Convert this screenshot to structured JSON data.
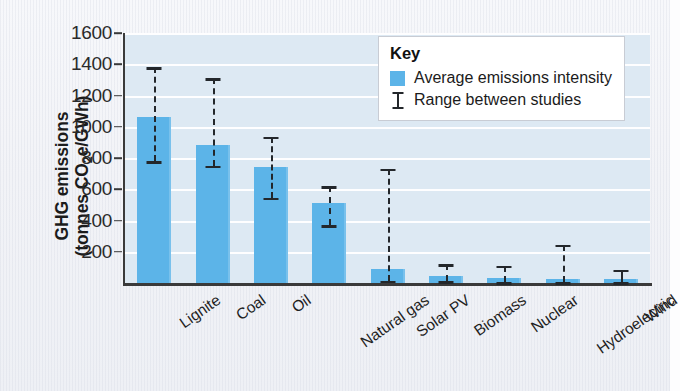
{
  "chart_data": {
    "type": "bar",
    "title": "",
    "xlabel": "",
    "ylabel_line1": "GHG emissions",
    "ylabel_line2_pre": "(tonnes CO",
    "ylabel_line2_sub": "2",
    "ylabel_line2_post": "e/GWh)",
    "ylim": [
      0,
      1600
    ],
    "ytick_values": [
      200,
      400,
      600,
      800,
      1000,
      1200,
      1400,
      1600
    ],
    "ytick_labels": [
      "200",
      "400",
      "600",
      "800",
      "1000",
      "1200",
      "1400",
      "1600"
    ],
    "grid": true,
    "legend_position": "top-right",
    "categories": [
      "Lignite",
      "Coal",
      "Oil",
      "Natural gas",
      "Solar PV",
      "Biomass",
      "Nuclear",
      "Hydroelectric",
      "Wind"
    ],
    "values": [
      1065,
      885,
      740,
      510,
      90,
      45,
      30,
      25,
      25
    ],
    "error_low": [
      780,
      750,
      545,
      370,
      15,
      10,
      5,
      5,
      5
    ],
    "error_high": [
      1380,
      1310,
      935,
      620,
      730,
      120,
      110,
      245,
      85
    ],
    "series": [
      {
        "name": "Average emissions intensity",
        "values": [
          1065,
          885,
          740,
          510,
          90,
          45,
          30,
          25,
          25
        ]
      }
    ],
    "bar_color": "#5cb4e8",
    "plot_background": "#dde9f3",
    "gridline_color": "#ffffff",
    "axis_color": "#3a3a3a",
    "error_bar_color": "#23272b"
  },
  "legend": {
    "title": "Key",
    "entries": [
      {
        "label": "Average emissions intensity",
        "marker": "swatch"
      },
      {
        "label": "Range between studies",
        "marker": "range"
      }
    ]
  }
}
